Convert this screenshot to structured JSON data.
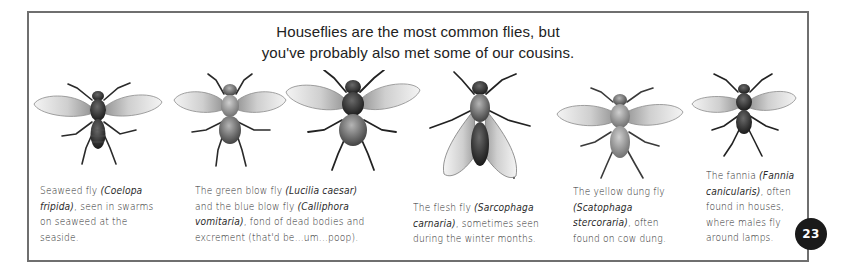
{
  "page": {
    "heading_lines": [
      "Houseflies are the most common flies, but",
      "you've probably also met some of our cousins."
    ],
    "page_number": "23",
    "colors": {
      "frame": "#6f6f6f",
      "text": "#2b2b2b",
      "badge_bg": "#1a1a1a",
      "badge_text": "#ffffff"
    }
  },
  "flies": [
    {
      "name": "seaweed-fly",
      "caption_parts": [
        {
          "text": "Seaweed fly ",
          "italic": false
        },
        {
          "text": "(Coelopa fripida)",
          "italic": true
        },
        {
          "text": ", seen in swarms on seaweed at the seaside.",
          "italic": false
        }
      ]
    },
    {
      "name": "green-blow-fly",
      "caption_parts": [
        {
          "text": "The green blow fly ",
          "italic": false
        },
        {
          "text": "(Lucilia caesar)",
          "italic": true
        },
        {
          "text": " and the blue blow fly ",
          "italic": false
        },
        {
          "text": "(Calliphora vomitaria)",
          "italic": true
        },
        {
          "text": ", fond of dead bodies and excrement (that'd be...um...poop).",
          "italic": false
        }
      ]
    },
    {
      "name": "blue-blow-fly",
      "caption_parts": []
    },
    {
      "name": "flesh-fly",
      "caption_parts": [
        {
          "text": "The flesh fly ",
          "italic": false
        },
        {
          "text": "(Sarcophaga carnaria)",
          "italic": true
        },
        {
          "text": ", sometimes seen during the winter months.",
          "italic": false
        }
      ]
    },
    {
      "name": "yellow-dung-fly",
      "caption_parts": [
        {
          "text": "The yellow dung fly ",
          "italic": false
        },
        {
          "text": "(Scatophaga stercoraria)",
          "italic": true
        },
        {
          "text": ", often found on cow dung.",
          "italic": false
        }
      ]
    },
    {
      "name": "fannia",
      "caption_parts": [
        {
          "text": "The fannia ",
          "italic": false
        },
        {
          "text": "(Fannia canicularis)",
          "italic": true
        },
        {
          "text": ", often found in houses, where males fly around lamps.",
          "italic": false
        }
      ]
    }
  ],
  "captions": {
    "seaweed": {
      "lines": [
        "Seaweed fly ",
        "(Coelopa",
        "fripida)",
        ", seen in swarms",
        "on seaweed at the",
        "seaside."
      ]
    },
    "blow": {
      "lines": [
        "The green blow fly ",
        "(Lucilia caesar)",
        "and the blue blow fly ",
        "(Calliphora",
        "vomitaria)",
        ", fond of dead bodies and",
        "excrement (that'd be...um...poop)."
      ]
    },
    "flesh": {
      "lines": [
        "The flesh fly ",
        "(Sarcophaga",
        "carnaria)",
        ", sometimes seen",
        "during the winter months."
      ]
    },
    "dung": {
      "lines": [
        "The yellow dung fly",
        "(Scatophaga",
        "stercoraria)",
        ", often",
        "found on cow dung."
      ]
    },
    "fannia": {
      "lines": [
        "The fannia ",
        "(Fannia",
        "canicularis)",
        ", often",
        "found in houses,",
        "where males fly",
        "around lamps."
      ]
    }
  }
}
